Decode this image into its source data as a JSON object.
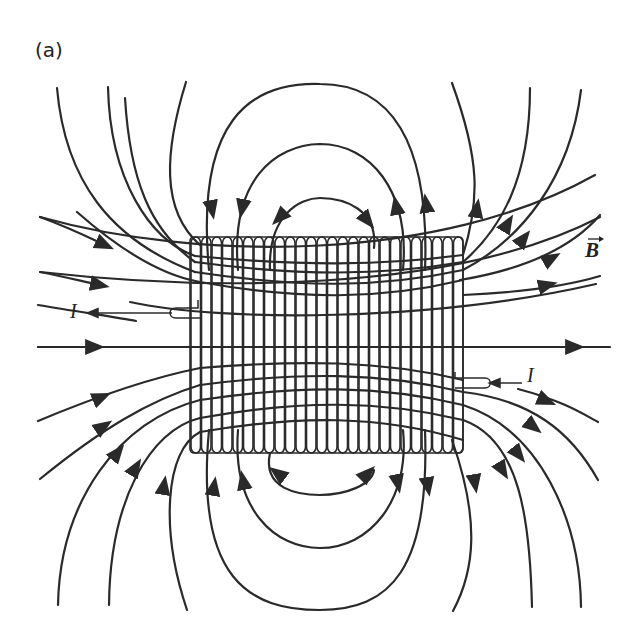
{
  "figure": {
    "panel_label": "(a)",
    "field_label": "B",
    "field_label_has_vector_arrow": true,
    "current_label_left": "I",
    "current_label_right": "I",
    "line_color": "#2a2a2a",
    "background": "#ffffff"
  },
  "solenoid": {
    "x": 190,
    "y": 237,
    "width": 273,
    "height": 216,
    "turns": 26
  }
}
